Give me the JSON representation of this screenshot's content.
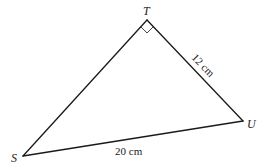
{
  "diagram": {
    "type": "right-triangle",
    "vertices": {
      "T": {
        "label": "T",
        "x": 147,
        "y": 20
      },
      "U": {
        "label": "U",
        "x": 243,
        "y": 121
      },
      "S": {
        "label": "S",
        "x": 23,
        "y": 156
      }
    },
    "right_angle_at": "T",
    "sides": {
      "TU": {
        "label": "12 cm"
      },
      "SU": {
        "label": "20 cm"
      }
    },
    "colors": {
      "stroke": "#1a1a1a",
      "text": "#222222",
      "background": "#ffffff"
    }
  }
}
